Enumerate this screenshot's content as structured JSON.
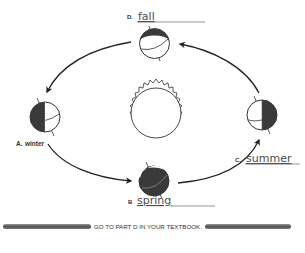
{
  "diagram": {
    "center": {
      "name": "Sun",
      "icon": "sun-icon"
    },
    "positions": [
      {
        "id": "A",
        "letter": "A.",
        "season": "winter",
        "answer_style": "printed",
        "location": "left"
      },
      {
        "id": "B",
        "letter": "B",
        "season": "spring",
        "answer_style": "handwritten",
        "location": "bottom"
      },
      {
        "id": "C",
        "letter": "C.",
        "season": "summer",
        "answer_style": "handwritten",
        "location": "right"
      },
      {
        "id": "D",
        "letter": "D.",
        "season": "fall",
        "answer_style": "handwritten",
        "location": "top"
      }
    ],
    "orbit_direction": "counterclockwise",
    "colors": {
      "ink": "#222222",
      "shade": "#4a4a4a",
      "line": "#555555",
      "background": "#ffffff"
    }
  },
  "footer": {
    "instruction": "GO TO PART D IN YOUR TEXTBOOK."
  }
}
